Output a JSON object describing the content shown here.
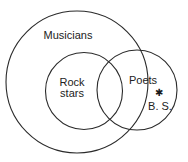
{
  "diagram": {
    "type": "venn",
    "sets": [
      {
        "id": "musicians",
        "label": "Musicians",
        "cx": 77,
        "cy": 82,
        "r": 71,
        "label_x": 68,
        "label_y": 39
      },
      {
        "id": "rock-stars",
        "label_lines": [
          "Rock",
          "stars"
        ],
        "cx": 84,
        "cy": 91,
        "r": 38.5,
        "label_x": 72,
        "label_y1": 86,
        "label_y2": 97
      },
      {
        "id": "poets",
        "label": "Poets",
        "cx": 137,
        "cy": 90,
        "r": 40,
        "label_x": 143,
        "label_y": 84
      }
    ],
    "points": [
      {
        "id": "bs",
        "label": "B. S.",
        "marker": "✱",
        "x": 159,
        "y": 92,
        "label_x": 160,
        "label_y": 110
      }
    ],
    "colors": {
      "stroke": "#2a2a2a",
      "text": "#222222",
      "background": "#ffffff"
    }
  }
}
